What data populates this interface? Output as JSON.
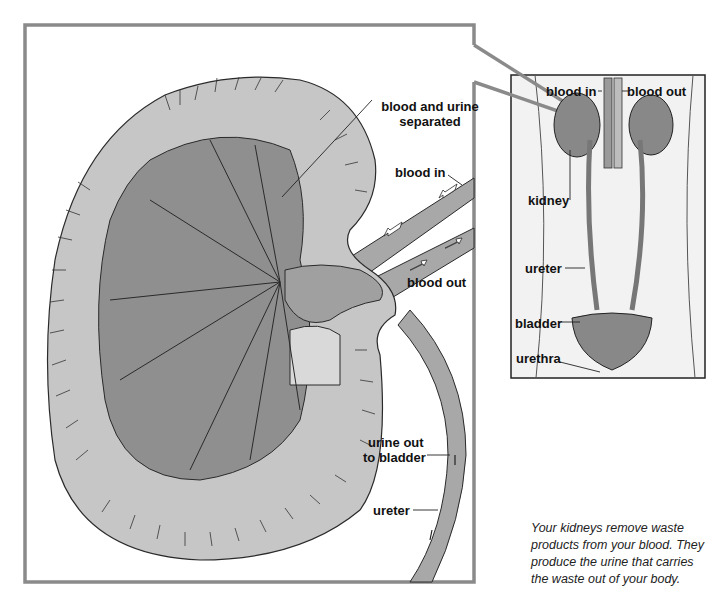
{
  "diagram": {
    "main_panel": {
      "labels": {
        "blood_and_urine_separated": "blood and urine separated",
        "blood_in": "blood in",
        "blood_out": "blood out",
        "urine_out_to_bladder_line1": "urine out",
        "urine_out_to_bladder_line2": "to bladder",
        "ureter": "ureter"
      }
    },
    "inset_panel": {
      "labels": {
        "blood_in": "blood in",
        "blood_out": "blood out",
        "kidney": "kidney",
        "ureter": "ureter",
        "bladder": "bladder",
        "urethra": "urethra"
      }
    },
    "caption": "Your kidneys remove waste products from your blood. They produce the urine that carries the waste out of your body.",
    "colors": {
      "frame": "#8a8a8a",
      "cortex": "#c4c4c4",
      "medulla": "#8e8e8e",
      "vessel": "#a8a8a8",
      "pelvis": "#d8d8d8",
      "outline": "#2a2a2a",
      "inset_bg": "#ededed"
    }
  }
}
